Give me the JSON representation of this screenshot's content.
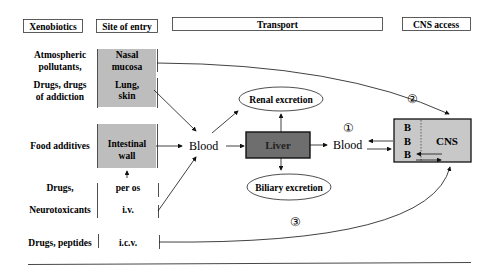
{
  "headers": {
    "xenobiotics": "Xenobiotics",
    "site_of_entry": "Site of entry",
    "transport": "Transport",
    "cns_access": "CNS access"
  },
  "xenobiotics": {
    "atmospheric_1": "Atmospheric",
    "atmospheric_2": "pollutants,",
    "drugs_addiction_1": "Drugs, drugs",
    "drugs_addiction_2": "of addiction",
    "food_additives": "Food additives",
    "drugs": "Drugs,",
    "neurotoxicants": "Neurotoxicants",
    "drugs_peptides": "Drugs, peptides"
  },
  "sites": {
    "nasal_1": "Nasal",
    "nasal_2": "mucosa",
    "lung_1": "Lung,",
    "lung_2": "skin",
    "intestinal_1": "Intestinal",
    "intestinal_2": "wall",
    "per_os": "per os",
    "iv": "i.v.",
    "icv": "i.c.v."
  },
  "transport": {
    "blood_1": "Blood",
    "liver": "Liver",
    "renal": "Renal excretion",
    "biliary": "Biliary excretion",
    "blood_2": "Blood"
  },
  "cns": {
    "b1": "B",
    "b2": "B",
    "b3": "B",
    "label": "CNS"
  },
  "routes": {
    "r1": "①",
    "r2": "②",
    "r3": "③"
  },
  "colors": {
    "entry_fill": "#bdbdbd",
    "liver_fill": "#6e6e6e",
    "cns_fill": "#c8c8c8"
  }
}
